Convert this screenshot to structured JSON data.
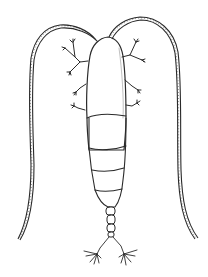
{
  "image": {
    "subject": "copepod",
    "style": "black ink line drawing on white",
    "colors": {
      "background": "#ffffff",
      "ink": "#2a2a2a"
    },
    "parts": [
      "prosome",
      "urosome",
      "furca",
      "antennules",
      "swimming-legs"
    ]
  }
}
